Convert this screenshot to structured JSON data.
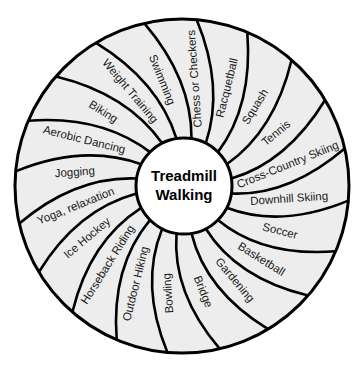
{
  "diagram": {
    "center_label_line1": "Treadmill",
    "center_label_line2": "Walking",
    "segments": [
      {
        "label": "Swimming"
      },
      {
        "label": "Chess or Checkers"
      },
      {
        "label": "Racquetball"
      },
      {
        "label": "Squash"
      },
      {
        "label": "Tennis"
      },
      {
        "label": "Cross-Country Skiing"
      },
      {
        "label": "Downhill Skiing"
      },
      {
        "label": "Soccer"
      },
      {
        "label": "Basketball"
      },
      {
        "label": "Gardening"
      },
      {
        "label": "Bridge"
      },
      {
        "label": "Bowling"
      },
      {
        "label": "Outdoor Hiking"
      },
      {
        "label": "Horseback Riding"
      },
      {
        "label": "Ice Hockey"
      },
      {
        "label": "Yoga, relaxation"
      },
      {
        "label": "Jogging"
      },
      {
        "label": "Aerobic Dancing"
      },
      {
        "label": "Biking"
      },
      {
        "label": "Weight Training"
      }
    ],
    "colors": {
      "segment_fill": "#ededed",
      "center_fill": "#ffffff",
      "stroke": "#000000",
      "text": "#1a1a1a"
    }
  }
}
